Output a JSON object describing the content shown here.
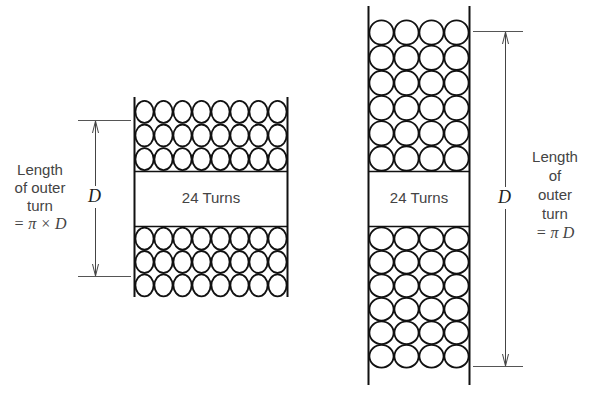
{
  "left_coil": {
    "label": "24 Turns",
    "columns": 8,
    "rows_top": 3,
    "rows_bottom": 3,
    "dimension_symbol": "D",
    "annotation": [
      "Length",
      "of outer",
      "turn",
      "= π × D"
    ]
  },
  "right_coil": {
    "label": "24 Turns",
    "columns": 4,
    "rows_top": 6,
    "rows_bottom": 6,
    "dimension_symbol": "D",
    "annotation": [
      "Length",
      "of",
      "outer",
      "turn",
      "= π D"
    ]
  }
}
